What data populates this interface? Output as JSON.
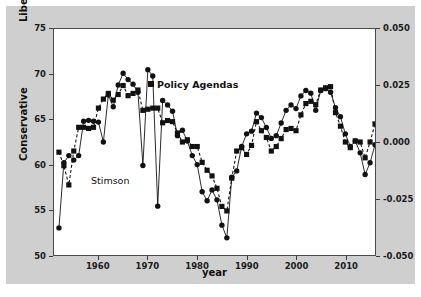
{
  "figure": {
    "background_color": "#cfcfcf",
    "plot_background_color": "#ffffff",
    "series_color": "#111111"
  },
  "axes": {
    "x_title": "year",
    "y_left_title_top": "Liberal",
    "y_left_title_bottom": "Conservative",
    "x_ticks": [
      "1960",
      "1970",
      "1980",
      "1990",
      "2000",
      "2010"
    ],
    "y_left_ticks": [
      "75",
      "70",
      "65",
      "60",
      "55",
      "50"
    ],
    "y_right_ticks": [
      "0.050",
      "0.025",
      "0.000",
      "-0.025",
      "-0.050"
    ]
  },
  "annotations": {
    "policy_agendas_label": "Policy Agendas",
    "stimson_label": "Stimson"
  },
  "chart_data": {
    "type": "line",
    "title": "",
    "xlabel": "year",
    "ylabel": "Liberal / Conservative",
    "y2label": "",
    "xlim": [
      1951,
      2016
    ],
    "ylim": [
      50,
      75
    ],
    "y2lim": [
      -0.05,
      0.05
    ],
    "grid": false,
    "legend_position": "inline-annotation",
    "x_ticks": [
      1960,
      1970,
      1980,
      1990,
      2000,
      2010
    ],
    "y_ticks": [
      50,
      55,
      60,
      65,
      70,
      75
    ],
    "y2_ticks": [
      -0.05,
      -0.025,
      0.0,
      0.025,
      0.05
    ],
    "series": [
      {
        "name": "Stimson",
        "axis": "left",
        "marker": "circle",
        "linestyle": "solid",
        "x": [
          1952,
          1953,
          1954,
          1955,
          1956,
          1957,
          1958,
          1959,
          1960,
          1961,
          1962,
          1963,
          1964,
          1965,
          1966,
          1967,
          1968,
          1969,
          1970,
          1971,
          1972,
          1973,
          1974,
          1975,
          1976,
          1977,
          1978,
          1979,
          1980,
          1981,
          1982,
          1983,
          1984,
          1985,
          1986,
          1987,
          1988,
          1989,
          1990,
          1991,
          1992,
          1993,
          1994,
          1995,
          1996,
          1997,
          1998,
          1999,
          2000,
          2001,
          2002,
          2003,
          2004,
          2005,
          2006,
          2007,
          2008,
          2009,
          2010,
          2011,
          2012,
          2013,
          2014,
          2015,
          2016
        ],
        "y": [
          53.0,
          60.2,
          61.0,
          60.5,
          61.0,
          64.8,
          64.9,
          64.8,
          64.7,
          62.5,
          67.7,
          66.4,
          68.8,
          70.1,
          69.4,
          68.9,
          68.0,
          59.9,
          70.5,
          69.8,
          55.4,
          67.1,
          66.6,
          65.9,
          63.2,
          63.8,
          62.6,
          61.0,
          60.0,
          57.0,
          56.0,
          57.2,
          56.1,
          53.3,
          51.9,
          58.6,
          59.3,
          62.0,
          63.4,
          63.7,
          65.7,
          65.2,
          64.1,
          62.9,
          63.2,
          64.6,
          66.0,
          66.6,
          66.2,
          67.6,
          68.2,
          67.9,
          66.0,
          68.2,
          68.4,
          68.0,
          66.3,
          65.3,
          63.4,
          62.0,
          62.6,
          61.3,
          58.9,
          60.2,
          62.2
        ]
      },
      {
        "name": "Policy Agendas",
        "axis": "right",
        "marker": "square",
        "linestyle": "dashed",
        "x": [
          1952,
          1953,
          1954,
          1955,
          1956,
          1957,
          1958,
          1959,
          1960,
          1961,
          1962,
          1963,
          1964,
          1965,
          1966,
          1967,
          1968,
          1969,
          1970,
          1971,
          1972,
          1973,
          1974,
          1975,
          1976,
          1977,
          1978,
          1979,
          1980,
          1981,
          1982,
          1983,
          1984,
          1985,
          1986,
          1987,
          1988,
          1989,
          1990,
          1991,
          1992,
          1993,
          1994,
          1995,
          1996,
          1997,
          1998,
          1999,
          2000,
          2001,
          2002,
          2003,
          2004,
          2005,
          2006,
          2007,
          2008,
          2009,
          2010,
          2011,
          2012,
          2013,
          2014,
          2015,
          2016
        ],
        "y": [
          -0.0045,
          -0.0105,
          -0.019,
          -0.004,
          0.0065,
          0.0065,
          0.006,
          0.0065,
          0.015,
          0.019,
          0.0215,
          0.0185,
          0.021,
          0.025,
          0.0205,
          0.0215,
          0.023,
          0.014,
          0.0145,
          0.015,
          0.015,
          0.0085,
          0.0095,
          0.009,
          0.004,
          0.0,
          0.001,
          -0.002,
          -0.002,
          -0.009,
          -0.0125,
          -0.015,
          -0.0205,
          -0.0285,
          -0.0305,
          -0.016,
          -0.004,
          -0.0025,
          -0.0055,
          -0.0015,
          0.009,
          0.005,
          0.002,
          -0.004,
          -0.002,
          0.0015,
          0.0055,
          0.006,
          0.005,
          0.012,
          0.017,
          0.018,
          0.0165,
          0.023,
          0.024,
          0.0245,
          0.013,
          0.007,
          0.0,
          -0.0025,
          0.0005,
          0.0,
          -0.007,
          0.0,
          0.008
        ]
      }
    ]
  }
}
